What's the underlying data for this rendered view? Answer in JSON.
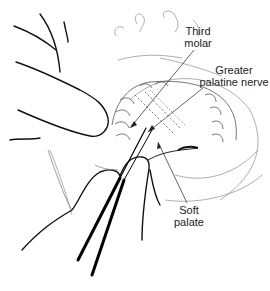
{
  "figure": {
    "labels": [
      {
        "id": "third-molar",
        "line1": "Third",
        "line2": "molar"
      },
      {
        "id": "greater-palatine-nerve",
        "line1": "Greater",
        "line2": "palatine nerve"
      },
      {
        "id": "soft-palate",
        "line1": "Soft",
        "line2": "palate"
      }
    ]
  }
}
